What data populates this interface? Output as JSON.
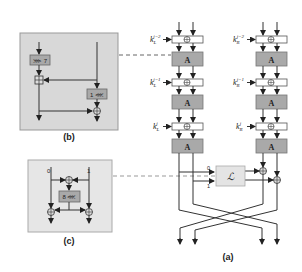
{
  "diagram": {
    "panels": {
      "a": {
        "label": "(a)"
      },
      "b": {
        "label": "(b)",
        "rotate_left": "⋙ 7",
        "rotate_right": "1 ⋘"
      },
      "c": {
        "label": "(c)",
        "input0": "0",
        "input1": "1",
        "rotate": "8 ⋘"
      }
    },
    "blocks": {
      "A": "A",
      "L": "ℒ"
    },
    "keys": {
      "left": [
        {
          "base": "k",
          "sub": "L",
          "sup": "j−2"
        },
        {
          "base": "k",
          "sub": "L",
          "sup": "j−1"
        },
        {
          "base": "k",
          "sub": "L",
          "sup": "j"
        }
      ],
      "right": [
        {
          "base": "k",
          "sub": "R",
          "sup": "j−2"
        },
        {
          "base": "k",
          "sub": "R",
          "sup": "j−1"
        },
        {
          "base": "k",
          "sub": "R",
          "sup": "j"
        }
      ]
    },
    "l_inputs": [
      "0",
      "1"
    ],
    "colors": {
      "a_box": "#a9a9a9",
      "panel_bg": "#d8d8d8",
      "l_box": "#e4e4e4",
      "line": "#333333",
      "dash": "#666666"
    }
  }
}
